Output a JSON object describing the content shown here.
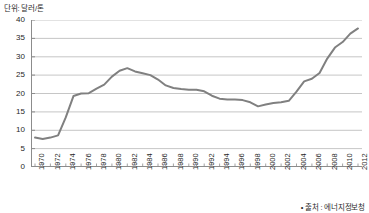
{
  "caption": {
    "unit_label": "단위: 달러/톤",
    "source_label": "• 출처 : 에너지정보청"
  },
  "chart_data": {
    "type": "line",
    "title": "",
    "subtitle": "",
    "xlabel": "",
    "ylabel": "단위: 달러/톤",
    "ylim": [
      0,
      40
    ],
    "ytick_step": 5,
    "yticks": [
      "0",
      "5",
      "10",
      "15",
      "20",
      "25",
      "30",
      "35",
      "40"
    ],
    "grid": true,
    "grid_axis": "y",
    "legend": "none",
    "line_color": "#808080",
    "line_width": 2,
    "markers": "none",
    "xlim": [
      1970,
      2012
    ],
    "xtick_labels": [
      "1970",
      "1972",
      "1974",
      "1976",
      "1978",
      "1980",
      "1982",
      "1984",
      "1986",
      "1988",
      "1990",
      "1992",
      "1994",
      "1996",
      "1998",
      "2000",
      "2002",
      "2004",
      "2006",
      "2008",
      "2010",
      "2012"
    ],
    "xtick_label_rotation": -90,
    "x": [
      1970,
      1971,
      1972,
      1973,
      1974,
      1975,
      1976,
      1977,
      1978,
      1979,
      1980,
      1981,
      1982,
      1983,
      1984,
      1985,
      1986,
      1987,
      1988,
      1989,
      1990,
      1991,
      1992,
      1993,
      1994,
      1995,
      1996,
      1997,
      1998,
      1999,
      2000,
      2001,
      2002,
      2003,
      2004,
      2005,
      2006,
      2007,
      2008,
      2009,
      2010,
      2011,
      2012
    ],
    "series": [
      {
        "name": "석탄 가격",
        "values": [
          8.0,
          7.6,
          8.0,
          8.6,
          13.5,
          19.3,
          20.0,
          20.1,
          21.3,
          22.4,
          24.6,
          26.2,
          26.9,
          26.0,
          25.5,
          25.0,
          23.8,
          22.2,
          21.5,
          21.2,
          21.0,
          21.0,
          20.6,
          19.4,
          18.6,
          18.4,
          18.4,
          18.2,
          17.6,
          16.5,
          17.0,
          17.4,
          17.6,
          18.0,
          20.5,
          23.3,
          24.0,
          25.6,
          29.5,
          32.5,
          34.0,
          36.3,
          37.7
        ]
      }
    ],
    "annotations": []
  }
}
